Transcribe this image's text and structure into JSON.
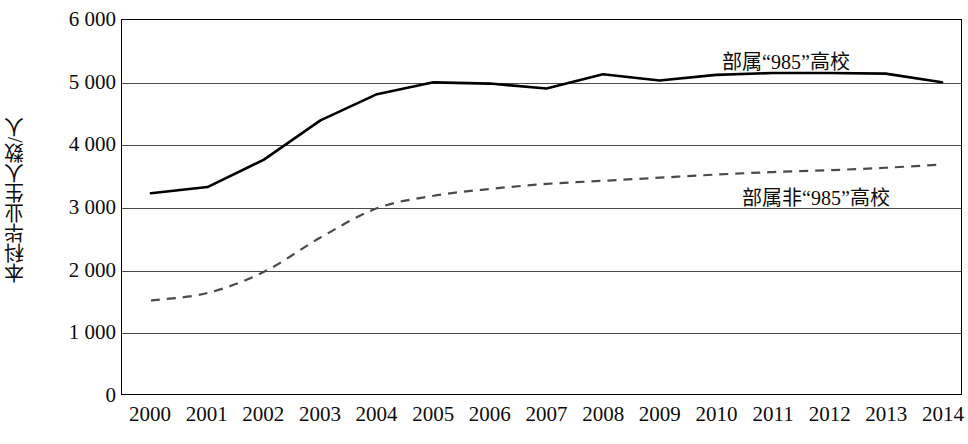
{
  "chart_data": {
    "type": "line",
    "title": "",
    "xlabel": "",
    "ylabel": "本科毕业生人数/人",
    "categories": [
      "2000",
      "2001",
      "2002",
      "2003",
      "2004",
      "2005",
      "2006",
      "2007",
      "2008",
      "2009",
      "2010",
      "2011",
      "2012",
      "2013",
      "2014"
    ],
    "x": [
      2000,
      2001,
      2002,
      2003,
      2004,
      2005,
      2006,
      2007,
      2008,
      2009,
      2010,
      2011,
      2012,
      2013,
      2014
    ],
    "ylim": [
      0,
      6000
    ],
    "xlim": [
      2000,
      2014
    ],
    "y_ticks": [
      0,
      1000,
      2000,
      3000,
      4000,
      5000,
      6000
    ],
    "y_tick_labels": [
      "0",
      "1 000",
      "2 000",
      "3 000",
      "4 000",
      "5 000",
      "6 000"
    ],
    "grid": "horizontal",
    "legend_position": "inline-right",
    "series": [
      {
        "name": "部属“985”高校",
        "style": "solid",
        "color": "#000000",
        "values": [
          3220,
          3320,
          3760,
          4390,
          4810,
          5000,
          4980,
          4900,
          5130,
          5030,
          5120,
          5150,
          5150,
          5140,
          5000
        ]
      },
      {
        "name": "部属非“985”高校",
        "style": "dashed",
        "color": "#4a4a4a",
        "values": [
          1500,
          1620,
          1960,
          2510,
          2980,
          3180,
          3290,
          3370,
          3420,
          3470,
          3520,
          3560,
          3590,
          3630,
          3680
        ]
      }
    ]
  },
  "axis": {
    "y_title": "本科毕业生人数/人",
    "y_labels": [
      "6 000",
      "5 000",
      "4 000",
      "3 000",
      "2 000",
      "1 000",
      "0"
    ],
    "x_labels": [
      "2000",
      "2001",
      "2002",
      "2003",
      "2004",
      "2005",
      "2006",
      "2007",
      "2008",
      "2009",
      "2010",
      "2011",
      "2012",
      "2013",
      "2014"
    ]
  },
  "legend": {
    "items": [
      {
        "label": "部属“985”高校"
      },
      {
        "label": "部属非“985”高校"
      }
    ]
  },
  "colors": {
    "series_solid": "#000000",
    "series_dashed": "#4a4a4a",
    "gridline": "#4a4a4a",
    "axis": "#000000",
    "background": "#ffffff"
  }
}
